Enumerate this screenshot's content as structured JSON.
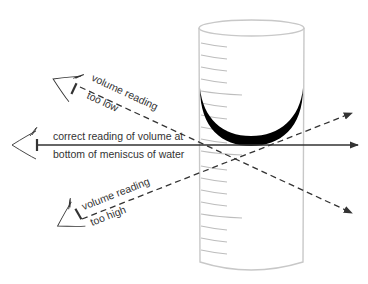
{
  "diagram": {
    "colors": {
      "line": "#333333",
      "cylinder_outline": "#c8c8c8",
      "graduation": "#bdbdbd",
      "meniscus": "#000000",
      "text": "#333333"
    },
    "labels": {
      "too_low_line1": "volume reading",
      "too_low_line2": "too low",
      "correct_line1": "correct reading of volume at",
      "correct_line2": "bottom of meniscus of water",
      "too_high_line1": "volume reading",
      "too_high_line2": "too high"
    },
    "elements": {
      "eyes": [
        "eye-too-low",
        "eye-correct",
        "eye-too-high"
      ],
      "sight_lines": [
        {
          "name": "too-low-sight-line",
          "style": "dashed"
        },
        {
          "name": "correct-sight-line",
          "style": "solid"
        },
        {
          "name": "too-high-sight-line",
          "style": "dashed"
        }
      ],
      "vessel": "graduated-cylinder",
      "liquid_surface": "meniscus"
    }
  }
}
